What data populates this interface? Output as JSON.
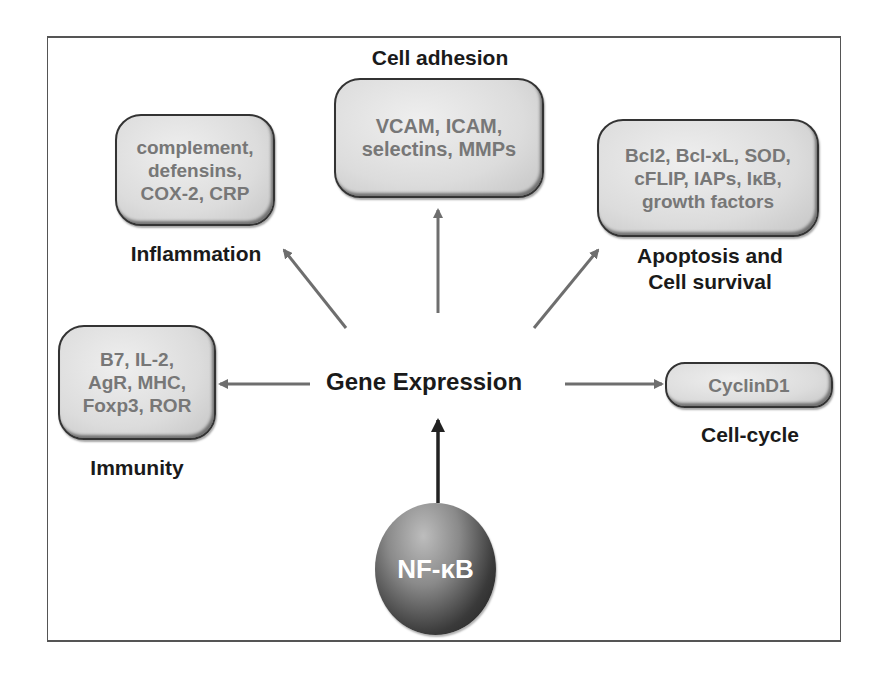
{
  "diagram": {
    "center": "Gene Expression",
    "source": "NF-κB",
    "nodes": [
      {
        "id": "inflammation",
        "box_text": "complement,\ndefensins,\nCOX-2, CRP",
        "label": "Inflammation"
      },
      {
        "id": "cell-adhesion",
        "box_text": "VCAM, ICAM,\nselectins, MMPs",
        "label": "Cell adhesion"
      },
      {
        "id": "apoptosis",
        "box_text": "Bcl2, Bcl-xL, SOD,\ncFLIP, IAPs, IκB,\ngrowth factors",
        "label": "Apoptosis and\nCell survival"
      },
      {
        "id": "immunity",
        "box_text": "B7, IL-2,\nAgR, MHC,\nFoxp3, ROR",
        "label": "Immunity"
      },
      {
        "id": "cell-cycle",
        "box_text": "CyclinD1",
        "label": "Cell-cycle"
      }
    ],
    "colors": {
      "arrow_gray": "#6e6e6e",
      "arrow_dark": "#222222",
      "box_text": "#777777",
      "label_text": "#1a1a1a"
    }
  }
}
